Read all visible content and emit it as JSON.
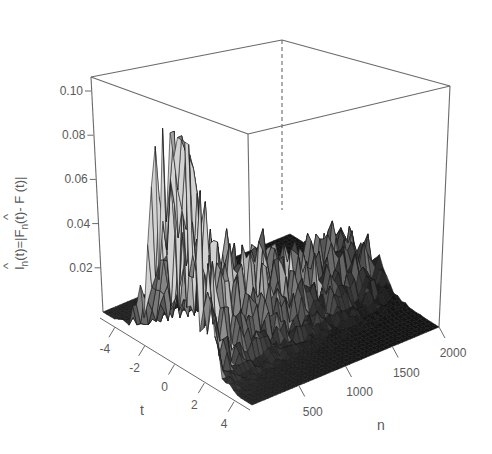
{
  "chart_data": {
    "type": "surface3d",
    "title": "",
    "xlabel": "t",
    "ylabel": "n",
    "zlabel": "Î_n(t)=|F̂_n(t)- F(t)|",
    "zlabel_parts": {
      "lhs_hat": "^",
      "lhs": "I",
      "lhs_sub": "n",
      "lhs_arg": "(t)=|",
      "rhs_hat": "^",
      "rhs": "F",
      "rhs_sub": "n",
      "rhs_tail": "(t)- F (t)|"
    },
    "x_axis": {
      "name": "t",
      "ticks": [
        -4,
        -2,
        0,
        2,
        4
      ],
      "tick_labels": [
        "-4",
        "-2",
        "0",
        "2",
        "4"
      ],
      "range": [
        -5,
        5
      ]
    },
    "y_axis": {
      "name": "n",
      "ticks": [
        500,
        1000,
        1500,
        2000
      ],
      "tick_labels": [
        "500",
        "1000",
        "1500",
        "2000"
      ],
      "range": [
        0,
        2000
      ]
    },
    "z_axis": {
      "name": "In(t)",
      "ticks": [
        0.02,
        0.04,
        0.06,
        0.08,
        0.1
      ],
      "tick_labels": [
        "0.02",
        "0.04",
        "0.06",
        "0.08",
        "0.10"
      ],
      "range": [
        0,
        0.11
      ]
    },
    "grid": false,
    "legend": null,
    "peaks": [
      {
        "t": -0.5,
        "n": 40,
        "z": 0.095
      },
      {
        "t": -1.2,
        "n": 60,
        "z": 0.075
      },
      {
        "t": 0.0,
        "n": 900,
        "z": 0.045
      },
      {
        "t": -0.3,
        "n": 600,
        "z": 0.035
      },
      {
        "t": 0.2,
        "n": 1200,
        "z": 0.037
      },
      {
        "t": 0.1,
        "n": 1400,
        "z": 0.035
      },
      {
        "t": -0.2,
        "n": 1700,
        "z": 0.032
      }
    ],
    "colors": {
      "surface_light": "#c8c8c8",
      "surface_dark": "#1a1a1a",
      "box": "#6a6a6a",
      "text": "#5a5a5a"
    }
  }
}
